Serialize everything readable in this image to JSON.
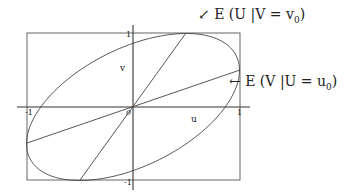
{
  "diagram": {
    "type": "bivariate-ellipse-regression-lines",
    "axes": {
      "u_label": "u",
      "v_label": "v",
      "origin_label": "0",
      "u_ticks": [
        "-1",
        "1"
      ],
      "v_ticks": [
        "1",
        "-1"
      ]
    },
    "annotations": {
      "u_given_v": {
        "arrow": "↙",
        "text": "E (U |V = v",
        "subscript": "0",
        "close": ")"
      },
      "v_given_u": {
        "arrow": "←",
        "text": "E (V |U = u",
        "subscript": "0",
        "close": ")"
      }
    },
    "lines": [
      {
        "name": "E(U|V=v0)",
        "from": [
          -0.5,
          -1
        ],
        "to": [
          0.5,
          1
        ]
      },
      {
        "name": "E(V|U=u0)",
        "from": [
          -1,
          -0.5
        ],
        "to": [
          1,
          0.5
        ]
      }
    ],
    "colors": {
      "stroke": "#333333",
      "background": "#ffffff"
    }
  }
}
